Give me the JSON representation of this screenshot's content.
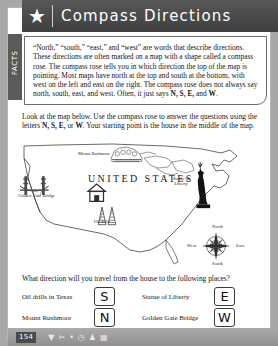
{
  "header": {
    "star_icon": "star-icon",
    "title": "Compass Directions"
  },
  "side_tab": {
    "label": "FACTS"
  },
  "facts": {
    "paragraph": "“North,” “south,” “east,” and “west” are words that describe directions. These directions are often marked on a map with a shape called a compass rose. The compass rose tells you in which direction the top of the map is pointing. Most maps have north at the top and south at the bottom, with west on the left and east on the right. The compass rose does not always say north, south, east, and west. Often, it just says ",
    "bold_tail": "N, S, E,",
    "bold_tail_2": "W",
    "tail_join": " and ",
    "tail_end": "."
  },
  "instructions": {
    "part1": "Look at the map below. Use the compass rose to answer the questions using the letters ",
    "bold1": "N, S, E,",
    "part2": " or ",
    "bold2": "W",
    "part3": ". Your starting point is the house in the middle of the map."
  },
  "map": {
    "country_title": "UNITED STATES",
    "labels": {
      "mount_rushmore": "Mount Rushmore",
      "golden_gate_bridge": "Golden Gate Bridge",
      "oil_drills": "Oil drills",
      "statue_of_liberty": "Statue of Liberty"
    },
    "compass_rose": {
      "north": "North",
      "south": "South",
      "east": "East",
      "west": "West"
    }
  },
  "questions": {
    "prompt": "What direction will you travel from the house to the following places?",
    "items": [
      {
        "label": "Oil drills in Texas",
        "answer": "S"
      },
      {
        "label": "Statue of Liberty",
        "answer": "E"
      },
      {
        "label": "Mount Rushmore",
        "answer": "N"
      },
      {
        "label": "Golden Gate Bridge",
        "answer": "W"
      }
    ]
  },
  "footer": {
    "page_number": "154",
    "icons": [
      "funnel-icon",
      "scissors-icon",
      "dot-icon",
      "clock-icon",
      "people-icon",
      "grid-icon"
    ]
  },
  "colors": {
    "header_bar": "#4a4a4a",
    "footer_bar": "#9e9e9e",
    "page_background": "#a8a8a8",
    "sheet": "#ffffff"
  }
}
